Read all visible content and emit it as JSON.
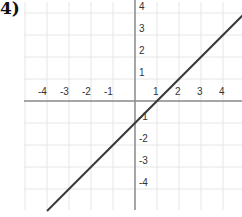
{
  "problem_label": "4)",
  "chart_data": {
    "type": "line",
    "title": "",
    "xlabel": "",
    "ylabel": "",
    "xlim": [
      -5,
      5
    ],
    "ylim": [
      -5,
      4.5
    ],
    "grid": true,
    "x_tick_labels": [
      "-4",
      "-3",
      "-2",
      "-1",
      "1",
      "2",
      "3",
      "4"
    ],
    "x_ticks": [
      -4,
      -3,
      -2,
      -1,
      1,
      2,
      3,
      4
    ],
    "y_tick_labels": [
      "4",
      "3",
      "2",
      "1",
      "-1",
      "-2",
      "-3",
      "-4"
    ],
    "y_ticks": [
      4,
      3,
      2,
      1,
      -1,
      -2,
      -3,
      -4
    ],
    "series": [
      {
        "name": "line",
        "equation": "y = x - 1",
        "slope": 1,
        "intercept": -1,
        "x": [
          -4,
          5
        ],
        "y": [
          -5,
          4
        ]
      }
    ],
    "colors": {
      "line": "#3a3a3a",
      "axis": "#888888",
      "grid": "#e6e6e6"
    }
  }
}
